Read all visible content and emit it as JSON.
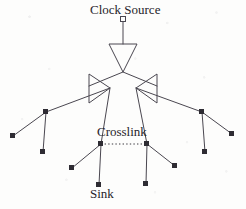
{
  "figure": {
    "kind": "clock-distribution-tree",
    "width": 246,
    "height": 209,
    "background_color": "#fdfdfc",
    "ink_color": "#4a4750",
    "node_fill_color": "#2e2c33"
  },
  "labels": {
    "clock_source": "Clock Source",
    "crosslink": "Crosslink",
    "sink": "Sink"
  },
  "diagram_data": {
    "type": "node-link-tree",
    "description": "A clock distribution tree driven from a clock source through an inverting buffer, branching into two mirrored buffers that fan out to leaf sinks, with a dotted crosslink tying two symmetric internal nodes together.",
    "source_marker": {
      "x": 123,
      "y": 19,
      "shape": "hollow-square",
      "size": 5
    },
    "buffers": [
      {
        "id": "root-buffer",
        "orientation": "down",
        "apex_x": 123,
        "apex_y": 72,
        "base_y": 44,
        "base_left_x": 109,
        "base_right_x": 137
      },
      {
        "id": "left-buffer",
        "orientation": "right",
        "apex_x": 110,
        "apex_y": 88,
        "base_x": 89,
        "base_top_y": 74,
        "base_bottom_y": 103
      },
      {
        "id": "right-buffer",
        "orientation": "left",
        "apex_x": 136,
        "apex_y": 88,
        "base_x": 157,
        "base_top_y": 74,
        "base_bottom_y": 103
      }
    ],
    "nodes": [
      {
        "id": "n-left-fork",
        "x": 46,
        "y": 112,
        "type": "internal",
        "shape": "square"
      },
      {
        "id": "n-right-fork",
        "x": 202,
        "y": 112,
        "type": "internal",
        "shape": "square"
      },
      {
        "id": "n-left-cross",
        "x": 101,
        "y": 144,
        "type": "crosslink-endpoint",
        "shape": "square"
      },
      {
        "id": "n-right-cross",
        "x": 147,
        "y": 144,
        "type": "crosslink-endpoint",
        "shape": "square"
      }
    ],
    "sinks": [
      {
        "id": "s1",
        "x": 13,
        "y": 136,
        "labelled": false
      },
      {
        "id": "s2",
        "x": 43,
        "y": 152,
        "labelled": false
      },
      {
        "id": "s3",
        "x": 72,
        "y": 168,
        "labelled": false
      },
      {
        "id": "s4",
        "x": 99,
        "y": 185,
        "labelled": true,
        "label": "Sink"
      },
      {
        "id": "s5",
        "x": 146,
        "y": 184,
        "labelled": false
      },
      {
        "id": "s6",
        "x": 175,
        "y": 166,
        "labelled": false
      },
      {
        "id": "s7",
        "x": 205,
        "y": 152,
        "labelled": false
      },
      {
        "id": "s8",
        "x": 232,
        "y": 134,
        "labelled": false
      }
    ],
    "edges": [
      {
        "from": "source-marker",
        "to": "root-buffer-base",
        "style": "solid"
      },
      {
        "from": "root-buffer-apex",
        "to": "left-buffer-base",
        "style": "solid"
      },
      {
        "from": "root-buffer-apex",
        "to": "right-buffer-base",
        "style": "solid"
      },
      {
        "from": "left-buffer-apex",
        "to": "n-left-fork",
        "style": "solid"
      },
      {
        "from": "left-buffer-apex",
        "to": "n-left-cross",
        "style": "solid"
      },
      {
        "from": "right-buffer-apex",
        "to": "n-right-fork",
        "style": "solid"
      },
      {
        "from": "right-buffer-apex",
        "to": "n-right-cross",
        "style": "solid"
      },
      {
        "from": "n-left-fork",
        "to": "s1",
        "style": "solid"
      },
      {
        "from": "n-left-fork",
        "to": "s2",
        "style": "solid"
      },
      {
        "from": "n-right-fork",
        "to": "s8",
        "style": "solid"
      },
      {
        "from": "n-right-fork",
        "to": "s7",
        "style": "solid"
      },
      {
        "from": "n-left-cross",
        "to": "s3",
        "style": "solid"
      },
      {
        "from": "n-left-cross",
        "to": "s4",
        "style": "solid"
      },
      {
        "from": "n-right-cross",
        "to": "s5",
        "style": "solid"
      },
      {
        "from": "n-right-cross",
        "to": "s6",
        "style": "solid"
      },
      {
        "from": "n-left-cross",
        "to": "n-right-cross",
        "style": "dotted",
        "label": "Crosslink"
      }
    ]
  }
}
